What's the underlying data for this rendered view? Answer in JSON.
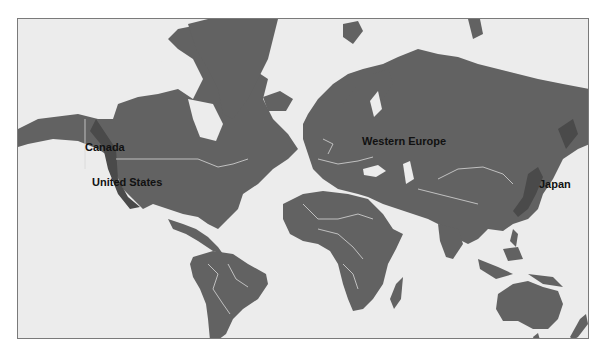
{
  "map": {
    "type": "world-political-outline",
    "projection": "mercator",
    "colors": {
      "ocean": "#ececec",
      "land": "#626262",
      "land_shadow": "#4a4a4a",
      "borders": "#d8d8d8",
      "frame": "#7a7a7a",
      "label_text": "#111111"
    },
    "labels": [
      {
        "id": "canada",
        "text": "Canada"
      },
      {
        "id": "united-states",
        "text": "United States"
      },
      {
        "id": "western-europe",
        "text": "Western Europe"
      },
      {
        "id": "japan",
        "text": "Japan"
      }
    ]
  }
}
